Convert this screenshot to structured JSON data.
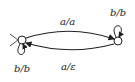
{
  "diagram": {
    "type": "state-machine",
    "states": [
      {
        "id": "q0",
        "initial": true,
        "cx": 22,
        "cy": 40
      },
      {
        "id": "q1",
        "initial": false,
        "cx": 118,
        "cy": 41
      }
    ],
    "transitions": [
      {
        "from": "q0",
        "to": "q1",
        "label": "a/a"
      },
      {
        "from": "q1",
        "to": "q0",
        "label": "a/ε"
      },
      {
        "from": "q0",
        "to": "q0",
        "label": "b/b"
      },
      {
        "from": "q1",
        "to": "q1",
        "label": "b/b"
      }
    ],
    "colors": {
      "stroke": "#222222",
      "background": "#ffffff"
    }
  }
}
